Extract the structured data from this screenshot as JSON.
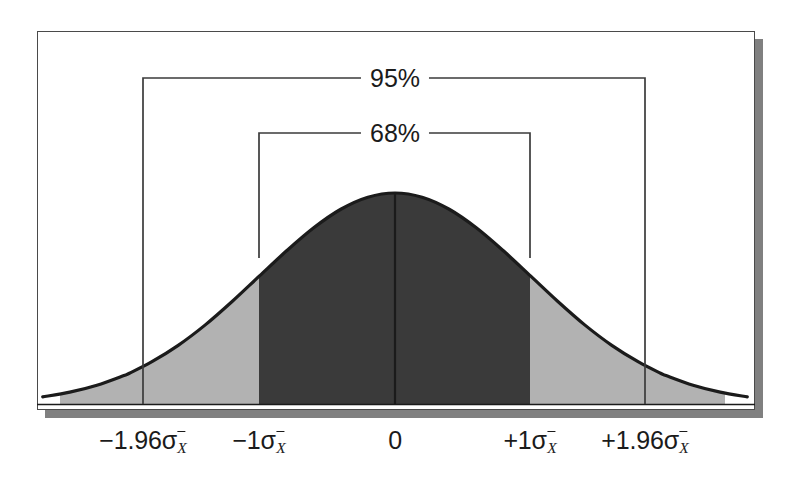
{
  "figure": {
    "colors": {
      "curve_line": "#1b1b1b",
      "inner_fill": "#3a3a3a",
      "outer_fill": "#b2b2b2",
      "frame_border": "#4a4a4a",
      "frame_shadow": "#808080",
      "background": "#ffffff",
      "text": "#1b1b1b"
    }
  },
  "axis": {
    "ticks": [
      {
        "label_prefix": "−1.96",
        "label_symbol": "σ",
        "label_sub": "X",
        "value": -1.96,
        "x": 143
      },
      {
        "label_prefix": "−1",
        "label_symbol": "σ",
        "label_sub": "X",
        "value": -1,
        "x": 259
      },
      {
        "label_prefix": "0",
        "label_symbol": "",
        "label_sub": "",
        "value": 0,
        "x": 395
      },
      {
        "label_prefix": "+1",
        "label_symbol": "σ",
        "label_sub": "X",
        "value": 1,
        "x": 530
      },
      {
        "label_prefix": "+1.96",
        "label_symbol": "σ",
        "label_sub": "X",
        "value": 1.96,
        "x": 645
      }
    ]
  },
  "brackets": [
    {
      "name": "confidence-95",
      "label": "95%",
      "y": 78,
      "left_x": 143,
      "right_x": 645,
      "leg_bottom": 404,
      "text_x": 395
    },
    {
      "name": "confidence-68",
      "label": "68%",
      "y": 133,
      "left_x": 259,
      "right_x": 530,
      "leg_bottom": 258,
      "text_x": 395
    }
  ],
  "chart_data": {
    "type": "area",
    "title": "",
    "subtitle": "",
    "xlabel": "",
    "ylabel": "",
    "distribution": "normal",
    "mean": 0,
    "sd": 1,
    "xlim": [
      -2.6,
      2.6
    ],
    "ylim": [
      0,
      1
    ],
    "grid": false,
    "legend_position": "none",
    "annotations": [
      "95%",
      "68%"
    ],
    "tick_labels": [
      "−1.96σX̄",
      "−1σX̄",
      "0",
      "+1σX̄",
      "+1.96σX̄"
    ],
    "tick_values": [
      -1.96,
      -1,
      0,
      1,
      1.96
    ],
    "regions": [
      {
        "name": "central-68",
        "from": -1,
        "to": 1,
        "area_percent": 68,
        "fill": "#3a3a3a"
      },
      {
        "name": "left-tail-band",
        "from": -1.96,
        "to": -1,
        "area_percent": 13.5,
        "fill": "#b2b2b2"
      },
      {
        "name": "right-tail-band",
        "from": 1,
        "to": 1.96,
        "area_percent": 13.5,
        "fill": "#b2b2b2"
      },
      {
        "name": "outer-left",
        "from": -2.6,
        "to": -1.96,
        "area_percent": 2.5,
        "fill": "#b2b2b2"
      },
      {
        "name": "outer-right",
        "from": 1.96,
        "to": 2.6,
        "area_percent": 2.5,
        "fill": "#b2b2b2"
      }
    ],
    "x": [
      -2.6,
      -2.4,
      -2.2,
      -2.0,
      -1.96,
      -1.8,
      -1.6,
      -1.4,
      -1.2,
      -1.0,
      -0.8,
      -0.6,
      -0.4,
      -0.2,
      0.0,
      0.2,
      0.4,
      0.6,
      0.8,
      1.0,
      1.2,
      1.4,
      1.6,
      1.8,
      1.96,
      2.0,
      2.2,
      2.4,
      2.6
    ],
    "y": [
      0.034,
      0.056,
      0.089,
      0.135,
      0.146,
      0.198,
      0.278,
      0.375,
      0.487,
      0.607,
      0.726,
      0.835,
      0.923,
      0.98,
      1.0,
      0.98,
      0.923,
      0.835,
      0.726,
      0.607,
      0.487,
      0.375,
      0.278,
      0.198,
      0.146,
      0.135,
      0.089,
      0.056,
      0.034
    ],
    "center_line": {
      "x": 0,
      "from_y": 0,
      "to_y": 1.0
    }
  }
}
